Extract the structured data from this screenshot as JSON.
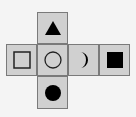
{
  "diagram": {
    "type": "cube-net",
    "faces": [
      {
        "position": "top",
        "symbol": "filled-triangle"
      },
      {
        "position": "left",
        "symbol": "hollow-square"
      },
      {
        "position": "center",
        "symbol": "hollow-circle"
      },
      {
        "position": "right",
        "symbol": "crescent"
      },
      {
        "position": "far-right",
        "symbol": "filled-square"
      },
      {
        "position": "bottom",
        "symbol": "filled-circle"
      }
    ],
    "colors": {
      "face": "#d0d0d0",
      "border": "#7a7a7a",
      "symbol": "#000000",
      "background": "#f4f4f4"
    }
  }
}
